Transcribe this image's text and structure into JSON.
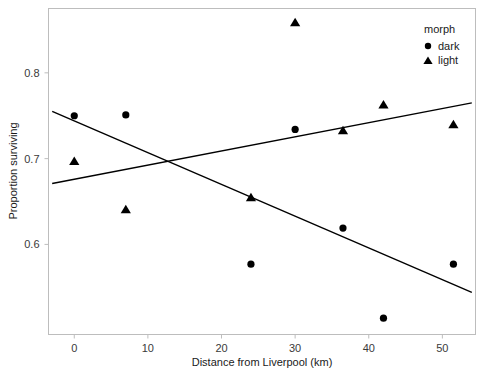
{
  "chart_data": {
    "type": "scatter",
    "title": "",
    "xlabel": "Distance from Liverpool (km)",
    "ylabel": "Proportion surviving",
    "xlim": [
      -3.5,
      54.5
    ],
    "ylim": [
      0.495,
      0.875
    ],
    "xticks": [
      0,
      10,
      20,
      30,
      40,
      50
    ],
    "yticks": [
      0.6,
      0.7,
      0.8
    ],
    "xtick_labels": [
      "0",
      "10",
      "20",
      "30",
      "40",
      "50"
    ],
    "ytick_labels": [
      "0.6",
      "0.7",
      "0.8"
    ],
    "grid": false,
    "legend": {
      "title": "morph",
      "position": "top-right",
      "entries": [
        {
          "label": "dark",
          "marker": "circle",
          "color": "#000000"
        },
        {
          "label": "light",
          "marker": "triangle",
          "color": "#000000"
        }
      ]
    },
    "series": [
      {
        "name": "dark",
        "marker": "circle",
        "color": "#000000",
        "points": [
          {
            "x": 0.0,
            "y": 0.75
          },
          {
            "x": 7.0,
            "y": 0.751
          },
          {
            "x": 24.0,
            "y": 0.577
          },
          {
            "x": 30.0,
            "y": 0.734
          },
          {
            "x": 36.5,
            "y": 0.619
          },
          {
            "x": 42.0,
            "y": 0.514
          },
          {
            "x": 51.5,
            "y": 0.577
          }
        ],
        "trend_line": {
          "x0": -3.0,
          "y0": 0.755,
          "x1": 54.0,
          "y1": 0.544
        }
      },
      {
        "name": "light",
        "marker": "triangle",
        "color": "#000000",
        "points": [
          {
            "x": 0.0,
            "y": 0.697
          },
          {
            "x": 7.0,
            "y": 0.641
          },
          {
            "x": 24.0,
            "y": 0.655
          },
          {
            "x": 30.0,
            "y": 0.859
          },
          {
            "x": 36.5,
            "y": 0.733
          },
          {
            "x": 42.0,
            "y": 0.763
          },
          {
            "x": 51.5,
            "y": 0.74
          }
        ],
        "trend_line": {
          "x0": -3.0,
          "y0": 0.671,
          "x1": 54.0,
          "y1": 0.765
        }
      }
    ]
  }
}
